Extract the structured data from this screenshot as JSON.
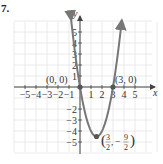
{
  "problem_number": "7.",
  "chart_data": {
    "type": "line",
    "title": "",
    "function": "y = 2x^2 - 6x",
    "xlabel": "x",
    "ylabel": "y",
    "xlim": [
      -5.5,
      6.5
    ],
    "ylim": [
      -5.5,
      6
    ],
    "grid": true,
    "x_ticks": [
      "-5",
      "-4",
      "-3",
      "-2",
      "-1",
      "1",
      "2",
      "3",
      "4",
      "5"
    ],
    "y_ticks": [
      "5",
      "4",
      "3",
      "2",
      "1",
      "-2",
      "-3",
      "-4",
      "-5"
    ],
    "series": [
      {
        "name": "parabola",
        "color": "#777777",
        "x": [
          -0.85,
          0,
          0.5,
          1,
          1.5,
          2,
          2.5,
          3,
          3.85
        ],
        "y": [
          6.5,
          0,
          -2.5,
          -4,
          -4.5,
          -4,
          -2.5,
          0,
          6.5
        ]
      }
    ],
    "points": [
      {
        "label": "(0, 0)",
        "x": 0,
        "y": 0
      },
      {
        "label": "(3, 0)",
        "x": 3,
        "y": 0
      },
      {
        "label": "(3/2, -9/2)",
        "x": 1.5,
        "y": -4.5
      }
    ]
  },
  "labels": {
    "origin": "(0, 0)",
    "root": "(3, 0)",
    "vertex_num_x": "3",
    "vertex_den_x": "2",
    "vertex_num_y": "9",
    "vertex_den_y": "2",
    "vertex_minus": "−"
  }
}
